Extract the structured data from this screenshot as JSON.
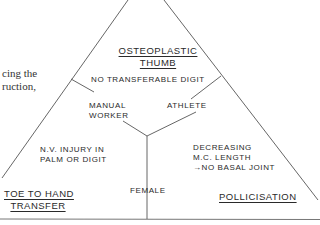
{
  "page_text_fragment": {
    "line1": "cing the",
    "line2": "ruction,"
  },
  "diagram": {
    "type": "triangle-decision-diagram",
    "line_color": "#555555",
    "text_color": "#2a2a2a",
    "corners": {
      "top": {
        "title_line1": "OSTEOPLASTIC",
        "title_line2": "THUMB",
        "condition": "NO TRANSFERABLE  DIGIT"
      },
      "bottom_left": {
        "title_line1": "TOE  TO HAND",
        "title_line2": "TRANSFER",
        "condition_line1": "N.V. INJURY IN",
        "condition_line2": "PALM OR DIGIT"
      },
      "bottom_right": {
        "title": "POLLICISATION",
        "condition_line1": "DECREASING",
        "condition_line2": "M.C. LENGTH",
        "condition_line3": "→NO BASAL JOINT"
      }
    },
    "divider_labels": {
      "left": {
        "line1": "MANUAL",
        "line2": "WORKER"
      },
      "right": "ATHLETE",
      "bottom": "FEMALE"
    }
  }
}
